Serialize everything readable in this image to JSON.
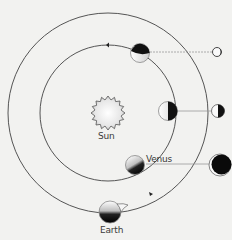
{
  "diagram": {
    "title": "",
    "sun": {
      "label": "Sun",
      "cx": 108,
      "cy": 113,
      "r": 15
    },
    "orbits": [
      {
        "name": "venus-orbit",
        "cx": 108,
        "cy": 113,
        "r": 68
      },
      {
        "name": "earth-orbit",
        "cx": 108,
        "cy": 113,
        "r": 100
      }
    ],
    "earth": {
      "label": "Earth",
      "cx": 110,
      "cy": 212,
      "r": 11
    },
    "venus_positions": [
      {
        "cx": 140,
        "cy": 53,
        "r": 10,
        "phase_cx": 217,
        "phase_cy": 52,
        "phase_r": 4.5,
        "phase": "crescent-lit-small"
      },
      {
        "cx": 168,
        "cy": 111,
        "r": 10,
        "phase_cx": 218,
        "phase_cy": 111,
        "phase_r": 6.5,
        "phase": "half"
      },
      {
        "cx": 135,
        "cy": 165,
        "r": 10,
        "label": "Venus",
        "phase_cx": 220,
        "phase_cy": 165,
        "phase_r": 11,
        "phase": "thin-crescent-large"
      }
    ],
    "colors": {
      "background": "#f2f2f0",
      "orbit_line": "#555555",
      "dark_side": "#111111",
      "connector": "#9a9a9a",
      "text": "#3a3a3a"
    }
  }
}
